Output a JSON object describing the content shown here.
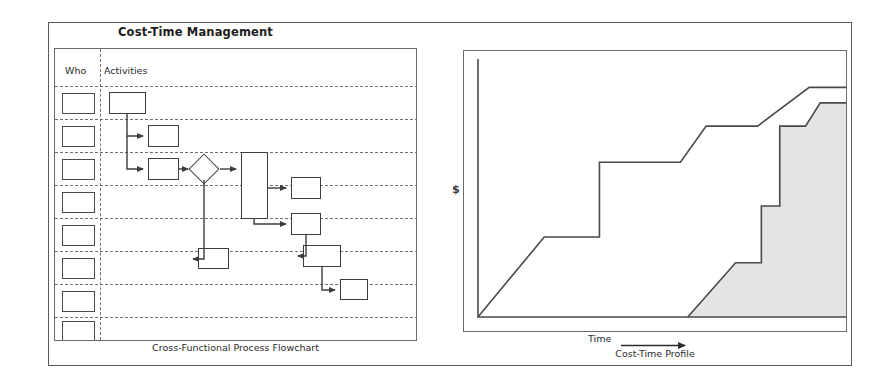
{
  "title": "Cost-Time Management",
  "flowchart": {
    "caption": "Cross-Functional Process Flowchart",
    "col_who_header": "Who",
    "col_activities_header": "Activities",
    "lane_count": 8,
    "who_box_count": 8
  },
  "chart": {
    "caption": "Cost-Time Profile",
    "y_axis_label": "$",
    "x_axis_label": "Time",
    "shade_color": "#e4e4e4",
    "line_color": "#4a4a4a"
  },
  "chart_data": {
    "type": "area",
    "title": "Cost-Time Profile",
    "xlabel": "Time",
    "ylabel": "$",
    "xlim": [
      0,
      100
    ],
    "ylim": [
      0,
      100
    ],
    "grid": false,
    "legend": "none",
    "series": [
      {
        "name": "Cumulative Cost (before improvement)",
        "filled": false,
        "x": [
          0,
          18,
          33,
          33,
          55,
          62,
          76,
          76,
          90,
          97,
          100
        ],
        "y": [
          0,
          31,
          31,
          60,
          60,
          74,
          74,
          74,
          89,
          89,
          89
        ]
      },
      {
        "name": "Cumulative Cost (after improvement)",
        "filled": true,
        "x": [
          57,
          70,
          77,
          77,
          82,
          82,
          89,
          93,
          100
        ],
        "y": [
          0,
          21,
          21,
          43,
          43,
          74,
          74,
          83,
          83
        ]
      }
    ]
  }
}
